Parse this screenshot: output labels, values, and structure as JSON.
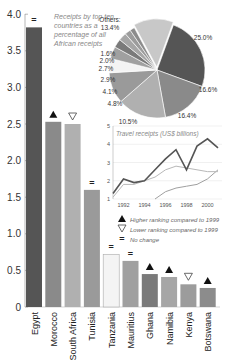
{
  "chart_data": [
    {
      "type": "bar",
      "title": "",
      "xlabel": "",
      "ylabel": "",
      "ylim": [
        0,
        4.0
      ],
      "yticks": [
        "0",
        "0.5",
        "1.0",
        "1.5",
        "2.0",
        "2.5",
        "3.0",
        "3.5",
        "4.0"
      ],
      "grid": false,
      "categories": [
        "Egypt",
        "Morocco",
        "South Africa",
        "Tunisia",
        "Tanzania",
        "Mauritius",
        "Ghana",
        "Namibia",
        "Kenya",
        "Botswana"
      ],
      "values": [
        3.82,
        2.53,
        2.5,
        1.6,
        0.72,
        0.63,
        0.45,
        0.41,
        0.31,
        0.26
      ],
      "ranking_change": [
        "no-change",
        "higher",
        "lower",
        "no-change",
        "no-change",
        "no-change",
        "higher",
        "higher",
        "lower",
        "higher"
      ],
      "colors": [
        "#555555",
        "#8a8a8a",
        "#b0b0b0",
        "#9a9a9a",
        "#f4f4f4",
        "#a0a0a0",
        "#7a7a7a",
        "#a6a6a6",
        "#9c9c9c",
        "#8c8c8c"
      ]
    },
    {
      "type": "pie",
      "title": "Receipts by top ten countries as a percentage of all African receipts",
      "labels": [
        "Egypt",
        "Morocco",
        "South Africa",
        "Tunisia",
        "Tanzania",
        "Mauritius",
        "Ghana",
        "Namibia",
        "Kenya",
        "Botswana",
        "Others"
      ],
      "values": [
        25.0,
        16.6,
        16.4,
        10.5,
        4.8,
        4.1,
        2.9,
        2.7,
        2.0,
        1.6,
        13.4
      ],
      "value_labels": [
        "25.0%",
        "16.6%",
        "16.4%",
        "10.5%",
        "4.8%",
        "4.1%",
        "2.9%",
        "2.7%",
        "2.0%",
        "1.6%",
        "13.4%"
      ],
      "others_label": "Others:",
      "colors": [
        "#555555",
        "#8a8a8a",
        "#b0b0b0",
        "#9a9a9a",
        "#f4f4f4",
        "#a0a0a0",
        "#7a7a7a",
        "#a6a6a6",
        "#9c9c9c",
        "#8c8c8c",
        "#c8c8c8"
      ]
    },
    {
      "type": "line",
      "title": "Travel receipts (US$ billions)",
      "x": [
        1991,
        1992,
        1993,
        1994,
        1995,
        1996,
        1997,
        1998,
        1999,
        2000,
        2001
      ],
      "xticks": [
        "1992",
        "1994",
        "1996",
        "1998",
        "2000"
      ],
      "ylim": [
        1,
        5
      ],
      "yticks": [
        "1",
        "2",
        "3",
        "4",
        "5"
      ],
      "series": [
        {
          "name": "Egypt",
          "color": "#555555",
          "values": [
            1.3,
            2.1,
            1.9,
            2.0,
            2.6,
            3.2,
            3.7,
            2.6,
            3.9,
            4.3,
            3.8
          ]
        },
        {
          "name": "Morocco",
          "color": "#b8b8b8",
          "values": [
            1.1,
            1.8,
            1.8,
            2.0,
            2.2,
            2.6,
            2.8,
            2.7,
            2.6,
            2.5,
            2.5
          ]
        },
        {
          "name": "South Africa",
          "color": "#a0a0a0",
          "values": [
            null,
            null,
            null,
            null,
            1.0,
            1.4,
            1.6,
            1.7,
            1.8,
            2.1,
            2.6
          ]
        }
      ]
    }
  ],
  "legend": {
    "higher": "Higher ranking compared to 1999",
    "lower": "Lower ranking compared to 1999",
    "same": "No change",
    "same_symbol": "="
  }
}
